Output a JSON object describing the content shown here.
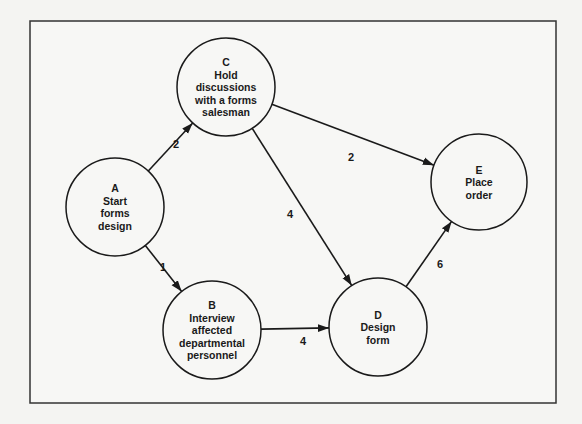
{
  "diagram": {
    "type": "network (activity-on-node)",
    "nodes": [
      {
        "id": "A",
        "label_lines": [
          "A",
          "Start",
          "forms",
          "design"
        ],
        "cx": 115,
        "cy": 207,
        "r": 49
      },
      {
        "id": "B",
        "label_lines": [
          "B",
          "Interview",
          "affected",
          "departmental",
          "personnel"
        ],
        "cx": 212,
        "cy": 330,
        "r": 49
      },
      {
        "id": "C",
        "label_lines": [
          "C",
          "Hold",
          "discussions",
          "with a forms",
          "salesman"
        ],
        "cx": 226,
        "cy": 87,
        "r": 49
      },
      {
        "id": "D",
        "label_lines": [
          "D",
          "Design",
          "form"
        ],
        "cx": 378,
        "cy": 327,
        "r": 49
      },
      {
        "id": "E",
        "label_lines": [
          "E",
          "Place",
          "order"
        ],
        "cx": 479,
        "cy": 182,
        "r": 48
      }
    ],
    "edges": [
      {
        "from": "A",
        "to": "C",
        "weight": "2",
        "label_x": 176,
        "label_y": 148
      },
      {
        "from": "A",
        "to": "B",
        "weight": "1",
        "label_x": 163,
        "label_y": 271
      },
      {
        "from": "C",
        "to": "E",
        "weight": "2",
        "label_x": 351,
        "label_y": 161
      },
      {
        "from": "C",
        "to": "D",
        "weight": "4",
        "label_x": 290,
        "label_y": 218
      },
      {
        "from": "B",
        "to": "D",
        "weight": "4",
        "label_x": 303,
        "label_y": 345
      },
      {
        "from": "D",
        "to": "E",
        "weight": "6",
        "label_x": 440,
        "label_y": 268
      }
    ]
  }
}
